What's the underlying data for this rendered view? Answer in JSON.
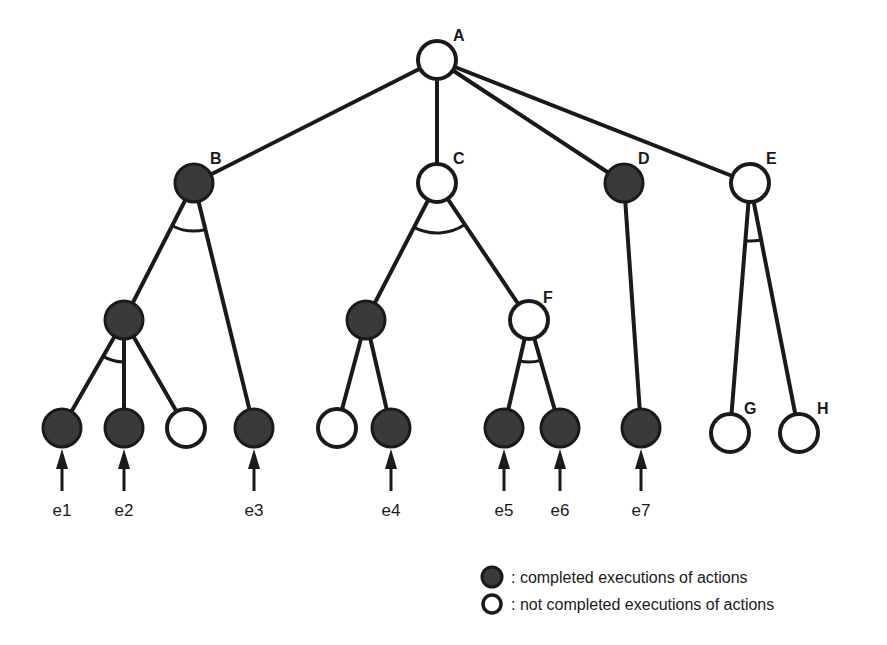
{
  "diagram": {
    "type": "and-or execution tree",
    "nodes": [
      {
        "id": "A",
        "label": "A",
        "x": 437,
        "y": 60,
        "status": "open",
        "show_label": true,
        "label_dx": 16,
        "label_dy": -24
      },
      {
        "id": "B",
        "label": "B",
        "x": 194,
        "y": 183,
        "status": "filled",
        "show_label": true,
        "label_dx": 16,
        "label_dy": -24
      },
      {
        "id": "C",
        "label": "C",
        "x": 437,
        "y": 183,
        "status": "open",
        "show_label": true,
        "label_dx": 16,
        "label_dy": -24
      },
      {
        "id": "D",
        "label": "D",
        "x": 624,
        "y": 183,
        "status": "filled",
        "show_label": true,
        "label_dx": 14,
        "label_dy": -24
      },
      {
        "id": "E",
        "label": "E",
        "x": 750,
        "y": 183,
        "status": "open",
        "show_label": true,
        "label_dx": 16,
        "label_dy": -24
      },
      {
        "id": "B1",
        "label": "",
        "x": 124,
        "y": 320,
        "status": "filled",
        "show_label": false
      },
      {
        "id": "C1",
        "label": "",
        "x": 366,
        "y": 320,
        "status": "filled",
        "show_label": false
      },
      {
        "id": "F",
        "label": "F",
        "x": 529,
        "y": 320,
        "status": "open",
        "show_label": true,
        "label_dx": 14,
        "label_dy": -22
      },
      {
        "id": "L1",
        "label": "",
        "x": 62,
        "y": 428,
        "status": "filled",
        "show_label": false
      },
      {
        "id": "L2",
        "label": "",
        "x": 124,
        "y": 428,
        "status": "filled",
        "show_label": false
      },
      {
        "id": "L3",
        "label": "",
        "x": 186,
        "y": 428,
        "status": "open",
        "show_label": false
      },
      {
        "id": "L4",
        "label": "",
        "x": 254,
        "y": 428,
        "status": "filled",
        "show_label": false
      },
      {
        "id": "L5",
        "label": "",
        "x": 337,
        "y": 428,
        "status": "open",
        "show_label": false
      },
      {
        "id": "L6",
        "label": "",
        "x": 391,
        "y": 428,
        "status": "filled",
        "show_label": false
      },
      {
        "id": "L7",
        "label": "",
        "x": 504,
        "y": 428,
        "status": "filled",
        "show_label": false
      },
      {
        "id": "L8",
        "label": "",
        "x": 560,
        "y": 428,
        "status": "filled",
        "show_label": false
      },
      {
        "id": "L9",
        "label": "",
        "x": 641,
        "y": 428,
        "status": "filled",
        "show_label": false
      },
      {
        "id": "G",
        "label": "G",
        "x": 730,
        "y": 433,
        "status": "open",
        "show_label": true,
        "label_dx": 14,
        "label_dy": -24
      },
      {
        "id": "H",
        "label": "H",
        "x": 799,
        "y": 433,
        "status": "open",
        "show_label": true,
        "label_dx": 18,
        "label_dy": -24
      }
    ],
    "edges": [
      [
        "A",
        "B"
      ],
      [
        "A",
        "C"
      ],
      [
        "A",
        "D"
      ],
      [
        "A",
        "E"
      ],
      [
        "B",
        "B1"
      ],
      [
        "B",
        "L4"
      ],
      [
        "B1",
        "L1"
      ],
      [
        "B1",
        "L2"
      ],
      [
        "B1",
        "L3"
      ],
      [
        "C",
        "C1"
      ],
      [
        "C",
        "F"
      ],
      [
        "C1",
        "L5"
      ],
      [
        "C1",
        "L6"
      ],
      [
        "F",
        "L7"
      ],
      [
        "F",
        "L8"
      ],
      [
        "D",
        "L9"
      ],
      [
        "E",
        "G"
      ],
      [
        "E",
        "H"
      ]
    ],
    "and_arcs": [
      {
        "at": "B",
        "from": "B1",
        "to": "L4",
        "radius": 48
      },
      {
        "at": "B1",
        "from": "L1",
        "to": "L2",
        "radius": 42
      },
      {
        "at": "C",
        "from": "C1",
        "to": "F",
        "radius": 50
      },
      {
        "at": "F",
        "from": "L7",
        "to": "L8",
        "radius": 42
      },
      {
        "at": "E",
        "from": "G",
        "to": "H",
        "radius": 58
      }
    ],
    "events": [
      {
        "label": "e1",
        "node": "L1"
      },
      {
        "label": "e2",
        "node": "L2"
      },
      {
        "label": "e3",
        "node": "L4"
      },
      {
        "label": "e4",
        "node": "L6"
      },
      {
        "label": "e5",
        "node": "L7"
      },
      {
        "label": "e6",
        "node": "L8"
      },
      {
        "label": "e7",
        "node": "L9"
      }
    ]
  },
  "legend": {
    "items": [
      {
        "symbol": "filled",
        "text": ": completed executions of actions"
      },
      {
        "symbol": "open",
        "text": ": not completed executions of actions"
      }
    ]
  },
  "colors": {
    "line": "#1a1a1a",
    "filled_node": "#3a3a3a",
    "open_node": "#ffffff",
    "background": "#ffffff"
  }
}
